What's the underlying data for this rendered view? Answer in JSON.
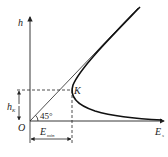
{
  "diagram": {
    "axes": {
      "y_label": "h",
      "x_label": "E",
      "x_label_subscript": "s",
      "origin_label": "O"
    },
    "point": {
      "label": "K"
    },
    "angle": {
      "value": "45°"
    },
    "h_marker": {
      "label": "h",
      "subscript": "K"
    },
    "e_marker": {
      "label": "E",
      "subscript": "min"
    }
  }
}
